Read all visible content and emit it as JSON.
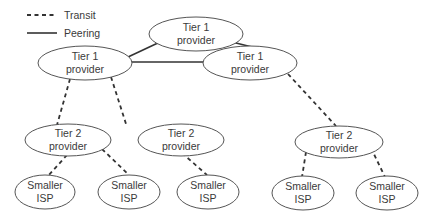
{
  "legend": {
    "transit_label": "Transit",
    "peering_label": "Peering"
  },
  "nodes": {
    "t1_top": {
      "line1": "Tier 1",
      "line2": "provider"
    },
    "t1_left": {
      "line1": "Tier 1",
      "line2": "provider"
    },
    "t1_right": {
      "line1": "Tier 1",
      "line2": "provider"
    },
    "t2_left": {
      "line1": "Tier 2",
      "line2": "provider"
    },
    "t2_mid": {
      "line1": "Tier 2",
      "line2": "provider"
    },
    "t2_right": {
      "line1": "Tier 2",
      "line2": "provider"
    },
    "isp1": {
      "line1": "Smaller",
      "line2": "ISP"
    },
    "isp2": {
      "line1": "Smaller",
      "line2": "ISP"
    },
    "isp3": {
      "line1": "Smaller",
      "line2": "ISP"
    },
    "isp4": {
      "line1": "Smaller",
      "line2": "ISP"
    },
    "isp5": {
      "line1": "Smaller",
      "line2": "ISP"
    }
  },
  "edges": [
    {
      "from": "t1_top",
      "to": "t1_left",
      "type": "peering"
    },
    {
      "from": "t1_top",
      "to": "t1_right",
      "type": "peering"
    },
    {
      "from": "t1_left",
      "to": "t1_right",
      "type": "peering"
    },
    {
      "from": "t1_left",
      "to": "t2_left",
      "type": "transit"
    },
    {
      "from": "t1_left",
      "to": "t2_mid",
      "type": "transit"
    },
    {
      "from": "t1_right",
      "to": "t2_right",
      "type": "transit"
    },
    {
      "from": "t2_left",
      "to": "isp1",
      "type": "transit"
    },
    {
      "from": "t2_left",
      "to": "isp2",
      "type": "transit"
    },
    {
      "from": "t2_mid",
      "to": "isp3",
      "type": "transit"
    },
    {
      "from": "t2_right",
      "to": "isp4",
      "type": "transit"
    },
    {
      "from": "t2_right",
      "to": "isp5",
      "type": "transit"
    }
  ]
}
